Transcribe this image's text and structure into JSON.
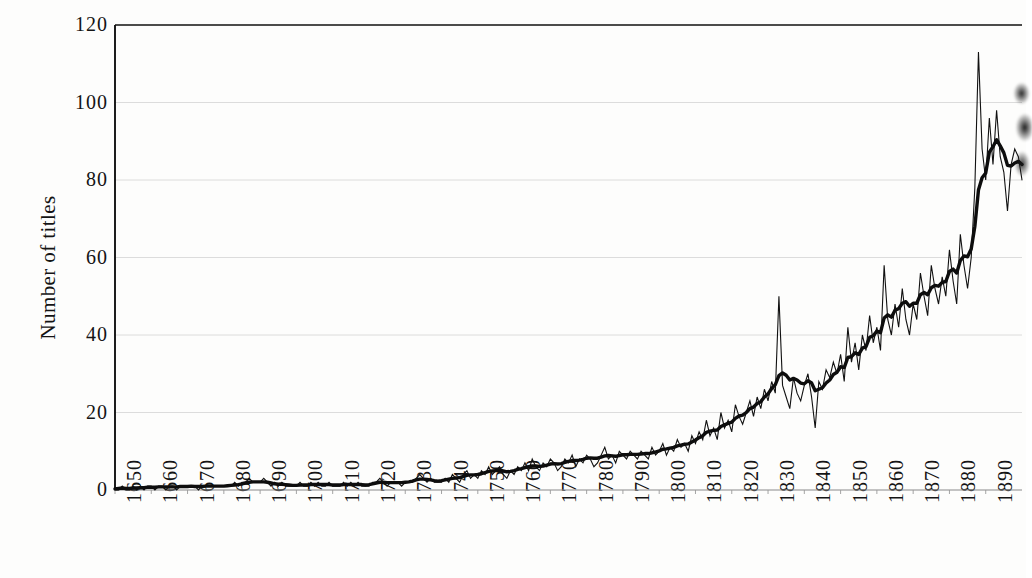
{
  "figure": {
    "background_color": "#fdfdfc",
    "ink_color": "#111111",
    "grid_color": "#d8d8d8"
  },
  "chart_data": {
    "type": "line",
    "title": "",
    "subtitle": "",
    "xlabel": "",
    "ylabel": "Number of titles",
    "xlim": [
      1650,
      1900
    ],
    "ylim": [
      0,
      120
    ],
    "yticks": [
      0,
      20,
      40,
      60,
      80,
      100,
      120
    ],
    "ytick_labels": [
      "0",
      "20",
      "40",
      "60",
      "80",
      "100",
      "120"
    ],
    "xticks": [
      1650,
      1660,
      1670,
      1680,
      1690,
      1700,
      1710,
      1720,
      1730,
      1740,
      1750,
      1760,
      1770,
      1780,
      1790,
      1800,
      1810,
      1820,
      1830,
      1840,
      1850,
      1860,
      1870,
      1880,
      1890
    ],
    "xtick_labels": [
      "1650",
      "1660",
      "1670",
      "1680",
      "1690",
      "1700",
      "1710",
      "1720",
      "1730",
      "1740",
      "1750",
      "1760",
      "1770",
      "1780",
      "1790",
      "1800",
      "1810",
      "1820",
      "1830",
      "1840",
      "1850",
      "1860",
      "1870",
      "1880",
      "1890"
    ],
    "grid": "horizontal",
    "legend": "none",
    "x_start": 1650,
    "x_step": 1,
    "series": [
      {
        "name": "Annual number of titles",
        "style": "thin-jagged",
        "line_width": 1.1,
        "color": "#111111",
        "values": [
          0,
          0,
          1,
          0,
          0,
          1,
          0,
          1,
          0,
          1,
          1,
          0,
          1,
          1,
          0,
          1,
          1,
          0,
          1,
          1,
          1,
          1,
          1,
          0,
          1,
          1,
          1,
          1,
          1,
          1,
          1,
          1,
          1,
          2,
          1,
          2,
          2,
          3,
          2,
          2,
          2,
          3,
          2,
          1,
          2,
          1,
          2,
          1,
          1,
          1,
          1,
          2,
          1,
          1,
          2,
          1,
          2,
          1,
          1,
          2,
          1,
          1,
          1,
          2,
          1,
          2,
          1,
          2,
          1,
          1,
          1,
          2,
          2,
          3,
          2,
          1,
          2,
          2,
          2,
          1,
          2,
          2,
          2,
          3,
          4,
          3,
          2,
          3,
          2,
          2,
          2,
          3,
          2,
          4,
          3,
          2,
          4,
          5,
          3,
          4,
          3,
          5,
          4,
          6,
          4,
          5,
          6,
          4,
          3,
          5,
          4,
          6,
          5,
          7,
          5,
          8,
          6,
          5,
          7,
          6,
          8,
          7,
          5,
          6,
          8,
          7,
          9,
          6,
          8,
          7,
          9,
          8,
          6,
          7,
          9,
          11,
          8,
          9,
          7,
          10,
          9,
          8,
          10,
          9,
          8,
          10,
          9,
          8,
          11,
          9,
          10,
          12,
          9,
          11,
          10,
          13,
          11,
          12,
          10,
          14,
          12,
          15,
          13,
          18,
          14,
          16,
          13,
          20,
          16,
          18,
          15,
          22,
          19,
          17,
          20,
          23,
          19,
          24,
          21,
          26,
          23,
          28,
          25,
          50,
          27,
          24,
          21,
          29,
          25,
          23,
          27,
          30,
          24,
          16,
          28,
          26,
          31,
          29,
          33,
          30,
          35,
          28,
          42,
          33,
          38,
          31,
          40,
          36,
          45,
          38,
          42,
          36,
          58,
          44,
          40,
          48,
          42,
          52,
          44,
          40,
          48,
          44,
          56,
          50,
          45,
          58,
          52,
          48,
          55,
          50,
          62,
          54,
          48,
          66,
          58,
          52,
          60,
          78,
          113,
          88,
          80,
          96,
          84,
          98,
          86,
          82,
          72,
          84,
          88,
          86,
          80
        ]
      },
      {
        "name": "Smoothed trend (moving average)",
        "style": "thick-smooth",
        "line_width": 3.4,
        "color": "#0d0d0d",
        "values": [
          0.3,
          0.4,
          0.5,
          0.4,
          0.4,
          0.5,
          0.5,
          0.6,
          0.6,
          0.7,
          0.7,
          0.7,
          0.8,
          0.8,
          0.8,
          0.8,
          0.8,
          0.8,
          0.9,
          0.9,
          0.9,
          1.0,
          0.9,
          0.9,
          0.9,
          1.0,
          1.0,
          1.0,
          1.0,
          1.0,
          1.0,
          1.1,
          1.2,
          1.3,
          1.4,
          1.6,
          1.8,
          2.0,
          2.1,
          2.1,
          2.1,
          2.1,
          2.0,
          1.8,
          1.6,
          1.5,
          1.5,
          1.4,
          1.3,
          1.2,
          1.2,
          1.3,
          1.3,
          1.3,
          1.4,
          1.4,
          1.4,
          1.4,
          1.4,
          1.4,
          1.3,
          1.3,
          1.3,
          1.4,
          1.4,
          1.4,
          1.4,
          1.4,
          1.4,
          1.3,
          1.4,
          1.6,
          1.8,
          2.0,
          2.0,
          1.9,
          1.9,
          1.9,
          1.9,
          1.9,
          2.0,
          2.1,
          2.3,
          2.6,
          2.8,
          2.8,
          2.7,
          2.6,
          2.4,
          2.3,
          2.4,
          2.6,
          2.8,
          3.0,
          3.1,
          3.2,
          3.5,
          3.8,
          3.9,
          3.9,
          4.0,
          4.2,
          4.5,
          4.8,
          4.9,
          5.0,
          5.1,
          4.9,
          4.7,
          4.8,
          5.0,
          5.3,
          5.5,
          5.8,
          6.0,
          6.2,
          6.2,
          6.1,
          6.2,
          6.4,
          6.7,
          6.8,
          6.7,
          6.8,
          7.1,
          7.4,
          7.6,
          7.6,
          7.7,
          7.9,
          8.2,
          8.3,
          8.2,
          8.2,
          8.5,
          8.8,
          8.9,
          8.8,
          8.7,
          8.9,
          9.1,
          9.1,
          9.2,
          9.2,
          9.2,
          9.3,
          9.4,
          9.4,
          9.6,
          9.8,
          10.1,
          10.5,
          10.6,
          10.8,
          11.0,
          11.4,
          11.6,
          11.8,
          11.9,
          12.4,
          12.9,
          13.5,
          14.0,
          14.9,
          15.2,
          15.4,
          15.5,
          16.4,
          16.8,
          17.2,
          17.5,
          18.5,
          19.1,
          19.3,
          20.0,
          21.0,
          21.4,
          22.3,
          22.8,
          24.0,
          24.8,
          26.2,
          27.2,
          29.5,
          30.2,
          29.6,
          28.4,
          28.8,
          28.4,
          27.6,
          27.4,
          28.2,
          27.6,
          25.6,
          26.0,
          26.4,
          27.6,
          28.4,
          29.8,
          30.4,
          31.8,
          31.6,
          34.2,
          34.4,
          35.4,
          35.0,
          36.6,
          37.0,
          39.4,
          39.8,
          41.0,
          40.6,
          44.4,
          45.2,
          44.6,
          46.4,
          46.8,
          48.2,
          48.6,
          47.4,
          48.2,
          48.2,
          50.4,
          51.0,
          50.4,
          52.2,
          52.8,
          52.6,
          53.6,
          53.8,
          56.4,
          57.0,
          56.0,
          59.2,
          60.4,
          60.2,
          62.2,
          68.0,
          77.4,
          80.6,
          81.8,
          87.2,
          88.6,
          90.4,
          88.8,
          87.0,
          83.8,
          83.6,
          84.4,
          84.8,
          84.0
        ]
      }
    ]
  },
  "axes": {
    "left_spine": true,
    "top_spine": true,
    "bottom_spine": true,
    "right_spine": false
  },
  "artifacts": {
    "right_edge_smudge": "scan-shadow"
  }
}
